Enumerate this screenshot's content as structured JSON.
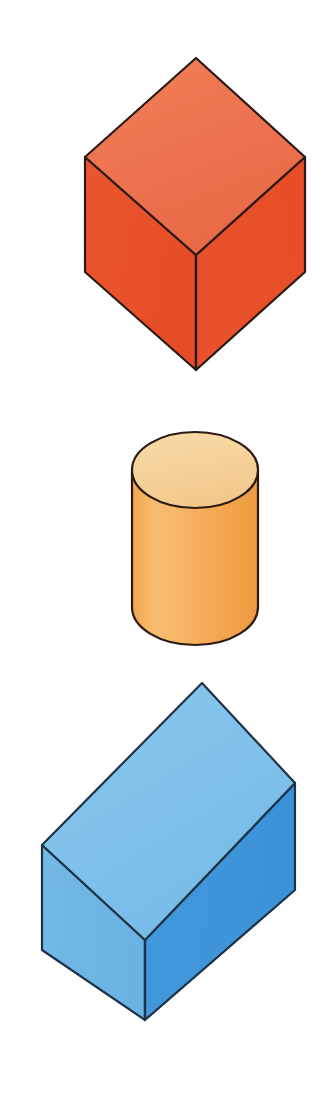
{
  "page": {
    "background_color": "#ffffff",
    "width": 332,
    "height": 1093,
    "outline_color": "#2b1a14",
    "outline_width": 2.2
  },
  "shapes": [
    {
      "id": "orange-cube",
      "name": "orange-cube",
      "label": "Orange cube",
      "type": "cube",
      "order": 1,
      "colors": {
        "top": "#ED7350",
        "left": "#E8502A",
        "right": "#E65028",
        "outline": "#2b1a14"
      },
      "geometry": {
        "top_vertex": [
          196,
          58
        ],
        "left_vertex": [
          85,
          157
        ],
        "right_vertex": [
          305,
          157
        ],
        "center_vertex": [
          196,
          255
        ],
        "bottom_vertex": [
          196,
          370
        ],
        "left_bottom": [
          85,
          272
        ],
        "right_bottom": [
          305,
          272
        ]
      },
      "faces": {
        "top": "196,58 85,157 196,255 305,157",
        "left": "85,157 85,272 196,370 196,255",
        "right": "305,157 305,272 196,370 196,255"
      }
    },
    {
      "id": "orange-cylinder",
      "name": "orange-cylinder",
      "label": "Orange cylinder",
      "type": "cylinder",
      "order": 2,
      "colors": {
        "top": "#F6D396",
        "body": "#F5A94E",
        "body_light": "#F8BC6E",
        "outline": "#2b1a14"
      },
      "geometry": {
        "center_x": 195,
        "left_x": 132,
        "right_x": 258,
        "radius_x": 63,
        "top_center_y": 470,
        "bottom_center_y": 607,
        "radius_y": 38,
        "top_y": 432,
        "bottom_y": 645
      }
    },
    {
      "id": "blue-box",
      "name": "blue-rectangular-prism",
      "label": "Blue rectangular prism",
      "type": "rectangular-prism",
      "order": 3,
      "colors": {
        "top": "#7FC1EA",
        "left": "#6FB6E4",
        "right": "#3D95DB",
        "outline": "#1f3348"
      },
      "geometry": {
        "top_vertex": [
          202,
          683
        ],
        "left_vertex": [
          42,
          845
        ],
        "right_vertex": [
          295,
          783
        ],
        "center_vertex": [
          145,
          940
        ],
        "bottom_vertex": [
          145,
          1020
        ],
        "left_bottom": [
          42,
          950
        ],
        "right_bottom": [
          295,
          890
        ]
      },
      "faces": {
        "top": "202,683 42,845 145,940 295,783",
        "left": "42,845 42,950 145,1020 145,940",
        "right": "295,783 295,890 145,1020 145,940"
      }
    }
  ]
}
